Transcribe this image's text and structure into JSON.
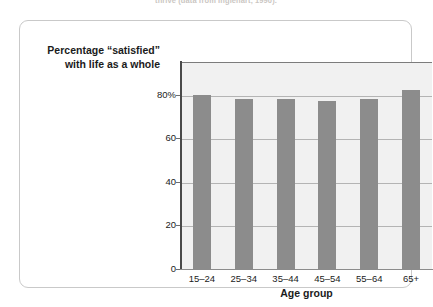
{
  "caption": {
    "top_text": "thrive (data from Inglehart, 1990)."
  },
  "figure": {
    "y_axis_caption_line1": "Percentage “satisfied”",
    "y_axis_caption_line2": "with life as a whole"
  },
  "colors": {
    "bar_fill": "#8c8c8c",
    "plot_background": "#f1f1f1",
    "gridline": "#b4b4b4",
    "axis": "#4a4a4a",
    "card_border": "#c9c9c9",
    "text": "#1b1b1b"
  },
  "chart_data": {
    "type": "bar",
    "title": "",
    "subtitle": "",
    "xlabel": "Age group",
    "ylabel": "Percentage “satisfied” with life as a whole",
    "categories": [
      "15–24",
      "25–34",
      "35–44",
      "45–54",
      "55–64",
      "65+"
    ],
    "values": [
      80,
      78,
      78,
      77,
      78,
      82
    ],
    "ylim": [
      0,
      95
    ],
    "ytick_values": [
      0,
      20,
      40,
      60,
      80
    ],
    "ytick_labels": [
      "0",
      "20",
      "40",
      "60",
      "80%"
    ],
    "grid": true,
    "legend": null,
    "legend_position": "none",
    "series": [
      {
        "name": "Percentage satisfied with life as a whole",
        "values": [
          80,
          78,
          78,
          77,
          78,
          82
        ]
      }
    ]
  }
}
